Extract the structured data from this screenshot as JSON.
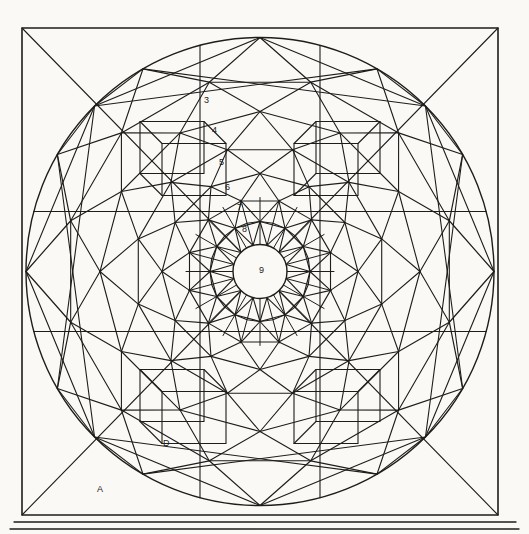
{
  "figure": {
    "background_color": "#faf9f6",
    "line_color": "#1d1d1b",
    "frame": {
      "square": {
        "x": 22,
        "y": 28,
        "width": 476,
        "height": 487
      },
      "circle": {
        "cx": 260,
        "cy": 271.5,
        "r": 234
      },
      "diagonals": true,
      "footer_rules": [
        {
          "x1": 14,
          "y1": 522,
          "x2": 516,
          "y2": 522
        },
        {
          "x1": 10,
          "y1": 529,
          "x2": 519,
          "y2": 529
        }
      ]
    },
    "rosette": {
      "center": {
        "cx": 260,
        "cy": 271.5
      },
      "points": 12,
      "hub_radius": 27,
      "spoke_count": 24,
      "ring_radii": [
        234,
        196,
        160,
        126,
        98,
        73,
        50,
        27
      ],
      "ring_labels": [
        "3",
        "4",
        "5",
        "6",
        "7",
        "8",
        "9"
      ]
    },
    "labels": [
      {
        "text": "3",
        "x": 207,
        "y": 101,
        "name": "construction-label-3"
      },
      {
        "text": "4",
        "x": 215,
        "y": 131,
        "name": "construction-label-4"
      },
      {
        "text": "5",
        "x": 222,
        "y": 163,
        "name": "construction-label-5"
      },
      {
        "text": "6",
        "x": 228,
        "y": 188,
        "name": "construction-label-6"
      },
      {
        "text": "7",
        "x": 240,
        "y": 208,
        "name": "construction-label-7"
      },
      {
        "text": "8",
        "x": 245,
        "y": 230,
        "name": "construction-label-8"
      },
      {
        "text": "9",
        "x": 262,
        "y": 271,
        "name": "center-label-9"
      },
      {
        "text": "D",
        "x": 166,
        "y": 444,
        "name": "region-label-d"
      },
      {
        "text": "A",
        "x": 100,
        "y": 490,
        "name": "region-label-a"
      }
    ]
  }
}
